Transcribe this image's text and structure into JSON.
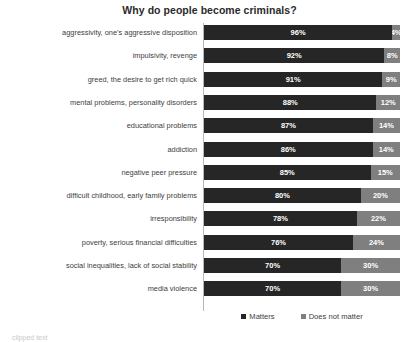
{
  "chart_data": {
    "type": "bar",
    "subtype": "stacked-horizontal-100",
    "title": "Why do people become criminals?",
    "xlabel": "",
    "ylabel": "",
    "xlim": [
      0,
      100
    ],
    "grid": false,
    "legend_position": "bottom",
    "categories": [
      "aggressivity, one’s aggressive disposition",
      "impulsivity, revenge",
      "greed, the desire to get rich quick",
      "mental problems, personality disorders",
      "educational problems",
      "addiction",
      "negative peer pressure",
      "difficult childhood, early family problems",
      "irresponsibility",
      "poverty, serious financial difficulties",
      "social inequalities, lack of social stability",
      "media violence"
    ],
    "series": [
      {
        "name": "Matters",
        "color": "#262626",
        "values": [
          96,
          92,
          91,
          88,
          87,
          86,
          85,
          80,
          78,
          76,
          70,
          70
        ],
        "labels": [
          "96%",
          "92%",
          "91%",
          "88%",
          "87%",
          "86%",
          "85%",
          "80%",
          "78%",
          "76%",
          "70%",
          "70%"
        ]
      },
      {
        "name": "Does not matter",
        "color": "#7f7f7f",
        "values": [
          4,
          8,
          9,
          12,
          14,
          14,
          15,
          20,
          22,
          24,
          30,
          30
        ],
        "labels": [
          "4%",
          "8%",
          "9%",
          "12%",
          "14%",
          "14%",
          "15%",
          "20%",
          "22%",
          "24%",
          "30%",
          "30%"
        ]
      }
    ]
  },
  "legend": {
    "items": [
      {
        "label": "Matters",
        "color": "#262626"
      },
      {
        "label": "Does not matter",
        "color": "#7f7f7f"
      }
    ]
  },
  "caption": {
    "text": "clipped text"
  }
}
